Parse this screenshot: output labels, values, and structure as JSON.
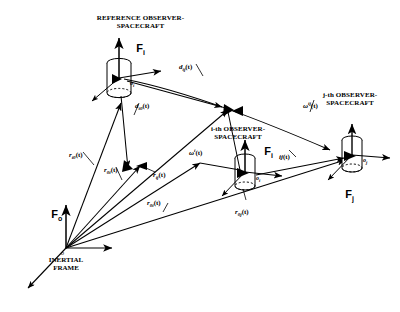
{
  "figure": {
    "type": "vector-geometry-diagram",
    "background": "#ffffff",
    "stroke": "#000000"
  },
  "captions": {
    "reference_spacecraft": "REFERENCE OBSERVER-\nSPACECRAFT",
    "i_spacecraft": "i-th OBSERVER-\nSPACECRAFT",
    "j_spacecraft": "j-th OBSERVER-\nSPACECRAFT",
    "inertial_frame": "INERTIAL\nFRAME"
  },
  "frames": {
    "f_inertial": "F",
    "f_inertial_sub": "o",
    "f_reference": "F",
    "f_reference_sub": "i",
    "f_i": "F",
    "f_i_sub": "i",
    "f_j": "F",
    "f_j_sub": "j"
  },
  "nodes": {
    "origin": "o",
    "reference": "o",
    "reference_sub": "i",
    "i_node": "o",
    "i_node_sub": "i",
    "j_node": "o",
    "j_node_sub": "j"
  },
  "vectors": [
    {
      "name": "d-ij",
      "base": "d",
      "sub": "ij",
      "arg": "(t)"
    },
    {
      "name": "d-i0",
      "base": "d",
      "sub": "i0",
      "arg": "(t)"
    },
    {
      "name": "r-i0",
      "base": "r",
      "sub": "i0",
      "arg": "(t)"
    },
    {
      "name": "r-0i",
      "base": "r",
      "sub": "0i",
      "arg": "(t)"
    },
    {
      "name": "r-ij",
      "base": "r",
      "sub": "ij",
      "arg": "(t)"
    },
    {
      "name": "r-0i-b",
      "base": "r",
      "sub": "0i",
      "arg": "(t)"
    },
    {
      "name": "r-0j",
      "base": "r",
      "sub": "0j",
      "arg": "(t)"
    }
  ],
  "angles": [
    {
      "name": "omega-i",
      "glyph": "ω",
      "sup": "i",
      "arg": "(t)"
    },
    {
      "name": "omega-ij",
      "glyph": "ω",
      "sup": "ij",
      "arg": "(t)"
    },
    {
      "name": "ij-t",
      "glyph": "ij",
      "sup": "",
      "arg": "(t)"
    }
  ],
  "labels": {
    "d_ij": "d",
    "d_ij_sub": "ij",
    "d_ij_arg": "(t)",
    "d_i0": "d",
    "d_i0_sub": "i0",
    "d_i0_arg": "(t)",
    "r_i0": "r",
    "r_i0_sub": "i0",
    "r_i0_arg": "(t)",
    "r_0i_left": "r",
    "r_0i_left_sub": "0i",
    "r_0i_left_arg": "(t)",
    "r_ij": "r",
    "r_ij_sub": "ij",
    "r_ij_arg": "(t)",
    "r_0i": "r",
    "r_0i_sub": "0i",
    "r_0i_arg": "(t)",
    "r_0j": "r",
    "r_0j_sub": "0j",
    "r_0j_arg": "(t)",
    "omega_i": "ω",
    "omega_i_sup": "i",
    "omega_i_arg": "(t)",
    "omega_ij": "ω",
    "omega_ij_sup": "ij",
    "omega_ij_arg": "(t)",
    "ij_t": "ij",
    "ij_t_sup": "",
    "ij_t_arg": "(t)"
  }
}
